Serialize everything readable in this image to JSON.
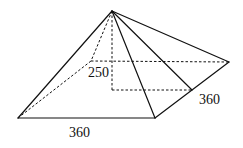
{
  "figure": {
    "type": "square pyramid",
    "labels": {
      "height": "250",
      "base_front": "360",
      "base_side": "360"
    },
    "colors": {
      "line": "#111111",
      "background": "#ffffff"
    }
  }
}
